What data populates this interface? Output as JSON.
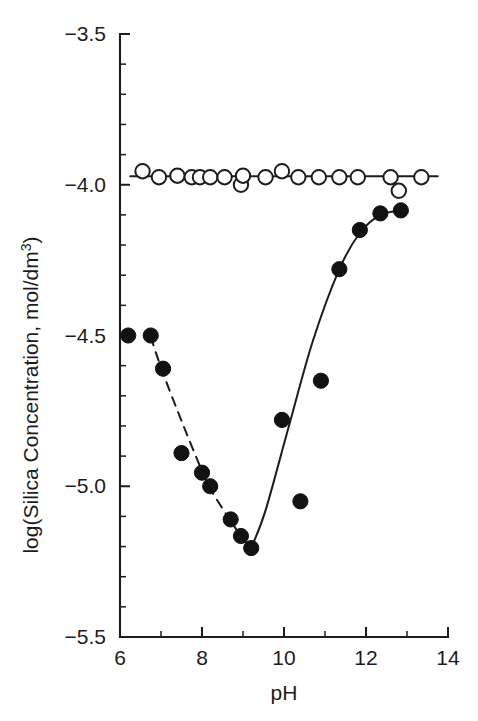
{
  "figure": {
    "background_color": "#ffffff",
    "ink_color": "#1c1c1c"
  },
  "chart_data": {
    "type": "scatter",
    "title": "",
    "subtitle": "",
    "xlabel": "pH",
    "ylabel": "log(Silica Concentration, mol/dm",
    "ylabel_superscript": "3",
    "ylabel_suffix": ")",
    "xlim": [
      6,
      14
    ],
    "ylim": [
      -5.5,
      -3.5
    ],
    "x_major_ticks": [
      6,
      8,
      10,
      12,
      14
    ],
    "x_major_tick_labels": [
      "6",
      "8",
      "10",
      "12",
      "14"
    ],
    "x_minor_ticks": [
      7,
      9,
      11,
      13
    ],
    "y_major_ticks": [
      -3.5,
      -4.0,
      -4.5,
      -5.0,
      -5.5
    ],
    "y_major_tick_labels": [
      "−3.5",
      "−4.0",
      "−4.5",
      "−5.0",
      "−5.5"
    ],
    "y_minor_ticks": [
      -3.6,
      -3.7,
      -3.8,
      -3.9,
      -4.1,
      -4.2,
      -4.3,
      -4.4,
      -4.6,
      -4.7,
      -4.8,
      -4.9,
      -5.1,
      -5.2,
      -5.3,
      -5.4
    ],
    "grid": false,
    "legend_position": "none",
    "axes_style": "left-and-bottom-spines-only",
    "series": [
      {
        "name": "open-circles",
        "marker": "open circle",
        "marker_fill": "#ffffff",
        "marker_edge": "#1c1c1c",
        "line_style": "solid-with-gaps",
        "points": [
          {
            "x": 6.55,
            "y": -3.955
          },
          {
            "x": 6.95,
            "y": -3.975
          },
          {
            "x": 7.4,
            "y": -3.97
          },
          {
            "x": 7.75,
            "y": -3.975
          },
          {
            "x": 7.95,
            "y": -3.975
          },
          {
            "x": 8.2,
            "y": -3.975
          },
          {
            "x": 8.55,
            "y": -3.975
          },
          {
            "x": 8.95,
            "y": -4.0
          },
          {
            "x": 9.0,
            "y": -3.97
          },
          {
            "x": 9.55,
            "y": -3.975
          },
          {
            "x": 9.95,
            "y": -3.955
          },
          {
            "x": 10.35,
            "y": -3.975
          },
          {
            "x": 10.85,
            "y": -3.975
          },
          {
            "x": 11.35,
            "y": -3.975
          },
          {
            "x": 11.8,
            "y": -3.975
          },
          {
            "x": 12.6,
            "y": -3.975
          },
          {
            "x": 12.8,
            "y": -4.02
          },
          {
            "x": 13.35,
            "y": -3.975
          }
        ]
      },
      {
        "name": "filled-circles",
        "marker": "filled circle",
        "marker_fill": "#121212",
        "marker_edge": "#121212",
        "line_style": "fitted-curve",
        "points": [
          {
            "x": 6.2,
            "y": -4.5
          },
          {
            "x": 6.75,
            "y": -4.5
          },
          {
            "x": 7.05,
            "y": -4.61
          },
          {
            "x": 7.5,
            "y": -4.89
          },
          {
            "x": 8.0,
            "y": -4.955
          },
          {
            "x": 8.2,
            "y": -5.0
          },
          {
            "x": 8.7,
            "y": -5.11
          },
          {
            "x": 8.95,
            "y": -5.165
          },
          {
            "x": 9.2,
            "y": -5.205
          },
          {
            "x": 9.95,
            "y": -4.78
          },
          {
            "x": 10.4,
            "y": -5.05
          },
          {
            "x": 10.9,
            "y": -4.65
          },
          {
            "x": 11.35,
            "y": -4.28
          },
          {
            "x": 11.85,
            "y": -4.15
          },
          {
            "x": 12.35,
            "y": -4.095
          },
          {
            "x": 12.85,
            "y": -4.085
          }
        ]
      }
    ],
    "fit_curves": [
      {
        "name": "filled-circles-fit",
        "style": "dashed-descending",
        "points": [
          {
            "x": 6.75,
            "y": -4.505
          },
          {
            "x": 7.05,
            "y": -4.625
          },
          {
            "x": 7.55,
            "y": -4.8
          },
          {
            "x": 8.05,
            "y": -4.965
          },
          {
            "x": 8.25,
            "y": -5.02
          },
          {
            "x": 8.7,
            "y": -5.115
          },
          {
            "x": 8.95,
            "y": -5.165
          },
          {
            "x": 9.2,
            "y": -5.205
          }
        ]
      },
      {
        "name": "filled-circles-fit-rising",
        "style": "solid-ascending",
        "points": [
          {
            "x": 9.2,
            "y": -5.205
          },
          {
            "x": 9.55,
            "y": -5.08
          },
          {
            "x": 10.1,
            "y": -4.81
          },
          {
            "x": 10.7,
            "y": -4.52
          },
          {
            "x": 11.35,
            "y": -4.28
          },
          {
            "x": 11.85,
            "y": -4.16
          },
          {
            "x": 12.35,
            "y": -4.1
          },
          {
            "x": 12.85,
            "y": -4.085
          }
        ]
      }
    ]
  }
}
